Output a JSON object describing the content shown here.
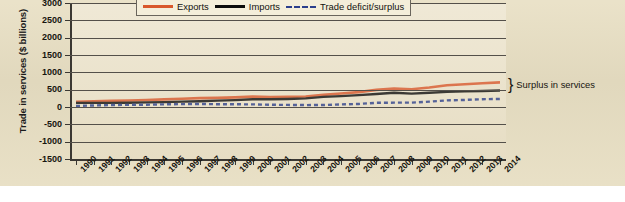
{
  "chart_data": {
    "type": "line",
    "title": "",
    "xlabel": "",
    "ylabel": "Trade in services ($ billions)",
    "ylim": [
      -1500,
      3000
    ],
    "ytick_values": [
      3000,
      2500,
      2000,
      1500,
      1000,
      500,
      0,
      -500,
      -1000,
      -1500
    ],
    "ytick_labels": [
      "3000",
      "2500",
      "2000",
      "1500",
      "1000",
      "500",
      "0",
      "-500",
      "-1000",
      "-1500"
    ],
    "grid": true,
    "legend_position": "top-center",
    "categories": [
      "1990",
      "1991",
      "1992",
      "1993",
      "1994",
      "1995",
      "1996",
      "1997",
      "1998",
      "1999",
      "2000",
      "2001",
      "2002",
      "2003",
      "2004",
      "2005",
      "2006",
      "2007",
      "2008",
      "2009",
      "2010",
      "2011",
      "2012",
      "2013",
      "2014"
    ],
    "series": [
      {
        "name": "Exports",
        "color": "#d9582c",
        "style": "solid",
        "values": [
          148,
          164,
          177,
          186,
          200,
          219,
          239,
          256,
          263,
          277,
          299,
          286,
          292,
          305,
          349,
          389,
          430,
          494,
          534,
          513,
          563,
          627,
          655,
          687,
          710
        ]
      },
      {
        "name": "Imports",
        "color": "#0b0b0b",
        "style": "solid",
        "values": [
          118,
          119,
          120,
          124,
          133,
          142,
          156,
          168,
          183,
          199,
          223,
          222,
          232,
          250,
          291,
          314,
          342,
          373,
          409,
          386,
          409,
          435,
          451,
          462,
          478
        ]
      },
      {
        "name": "Trade deficit/surplus",
        "color": "#2b3f8c",
        "style": "dashed",
        "values": [
          30,
          45,
          57,
          62,
          67,
          77,
          83,
          88,
          80,
          78,
          76,
          64,
          60,
          55,
          58,
          75,
          88,
          121,
          125,
          127,
          154,
          192,
          204,
          225,
          232
        ]
      }
    ],
    "annotations": [
      {
        "text": "Surplus in services",
        "marker": "brace",
        "at": "2014"
      }
    ]
  },
  "legend": {
    "items": [
      {
        "label": "Exports",
        "swatch": "solid-orange-line"
      },
      {
        "label": "Imports",
        "swatch": "solid-black-line"
      },
      {
        "label": "Trade deficit/surplus",
        "swatch": "dashed-blue-line"
      }
    ]
  },
  "annotation": {
    "brace": "}",
    "label": "Surplus in services"
  },
  "axes": {
    "y_title": "Trade in services ($ billions)"
  }
}
